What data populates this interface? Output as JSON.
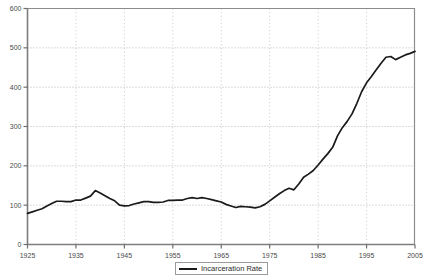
{
  "chart_data": {
    "type": "line",
    "title": "",
    "subtitle": "",
    "xlabel": "",
    "ylabel": "",
    "xlim": [
      1925,
      2005
    ],
    "ylim": [
      0,
      600
    ],
    "xticks": [
      1925,
      1935,
      1945,
      1955,
      1965,
      1975,
      1985,
      1995,
      2005
    ],
    "yticks": [
      0,
      100,
      200,
      300,
      400,
      500,
      600
    ],
    "grid": "horizontal-dotted-and-vertical-dotted",
    "legend_position": "bottom-center",
    "line_color": "#1a1a1a",
    "grid_color": "#b0b0b0",
    "axis_color": "#808080",
    "background_color": "#ffffff",
    "series": [
      {
        "name": "Incarceration Rate",
        "x": [
          1925,
          1926,
          1927,
          1928,
          1929,
          1930,
          1931,
          1932,
          1933,
          1934,
          1935,
          1936,
          1937,
          1938,
          1939,
          1940,
          1941,
          1942,
          1943,
          1944,
          1945,
          1946,
          1947,
          1948,
          1949,
          1950,
          1951,
          1952,
          1953,
          1954,
          1955,
          1956,
          1957,
          1958,
          1959,
          1960,
          1961,
          1962,
          1963,
          1964,
          1965,
          1966,
          1967,
          1968,
          1969,
          1970,
          1971,
          1972,
          1973,
          1974,
          1975,
          1976,
          1977,
          1978,
          1979,
          1980,
          1981,
          1982,
          1983,
          1984,
          1985,
          1986,
          1987,
          1988,
          1989,
          1990,
          1991,
          1992,
          1993,
          1994,
          1995,
          1996,
          1997,
          1998,
          1999,
          2000,
          2001,
          2002,
          2003,
          2004,
          2005
        ],
        "values": [
          79,
          83,
          87,
          91,
          98,
          104,
          110,
          110,
          109,
          109,
          113,
          113,
          118,
          123,
          137,
          131,
          124,
          117,
          111,
          100,
          98,
          99,
          103,
          106,
          109,
          109,
          107,
          107,
          108,
          112,
          112,
          113,
          113,
          117,
          119,
          117,
          119,
          117,
          114,
          111,
          108,
          102,
          98,
          94,
          97,
          96,
          95,
          93,
          96,
          102,
          111,
          120,
          129,
          137,
          143,
          139,
          154,
          171,
          179,
          188,
          202,
          217,
          231,
          247,
          276,
          297,
          313,
          332,
          359,
          389,
          411,
          427,
          444,
          461,
          476,
          478,
          470,
          476,
          482,
          486,
          491
        ]
      }
    ]
  },
  "legend": {
    "label": "Incarceration Rate"
  },
  "axis": {
    "y_tick_labels": [
      "600",
      "500",
      "400",
      "300",
      "200",
      "100",
      "0"
    ],
    "x_tick_labels": [
      "1925",
      "1935",
      "1945",
      "1955",
      "1965",
      "1975",
      "1985",
      "1995",
      "2005"
    ]
  }
}
